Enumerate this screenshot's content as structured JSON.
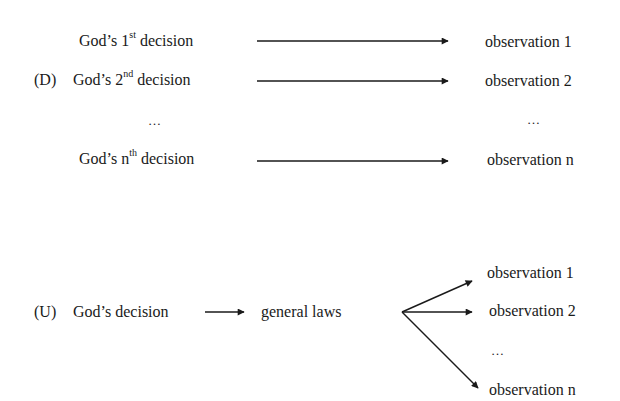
{
  "diagram_d": {
    "label": "(D)",
    "rows": [
      {
        "prefix": "God’s 1",
        "sup": "st",
        "suffix": "decision",
        "target": "observation 1"
      },
      {
        "prefix": "God’s 2",
        "sup": "nd",
        "suffix": "decision",
        "target": "observation 2"
      },
      {
        "prefix": "God’s n",
        "sup": "th",
        "suffix": "decision",
        "target": "observation n"
      }
    ],
    "ellipsis_left": "…",
    "ellipsis_right": "…"
  },
  "diagram_u": {
    "label": "(U)",
    "source": "God’s decision",
    "middle": "general laws",
    "targets": [
      "observation 1",
      "observation 2",
      "observation n"
    ],
    "ellipsis": "…"
  },
  "colors": {
    "ink": "#1a1a1a",
    "background": "#ffffff"
  }
}
